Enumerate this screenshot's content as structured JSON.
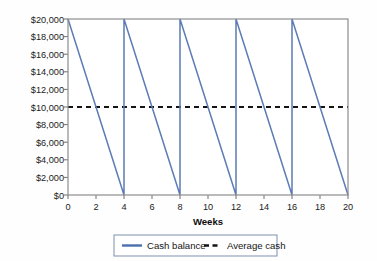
{
  "chart_data": {
    "type": "line",
    "title": "",
    "subtitle": "",
    "xlabel": "Weeks",
    "ylabel": "",
    "xlim": [
      0,
      20
    ],
    "ylim": [
      0,
      20000
    ],
    "grid": false,
    "legend_position": "bottom",
    "x_ticks": [
      0,
      2,
      4,
      6,
      8,
      10,
      12,
      14,
      16,
      18,
      20
    ],
    "x_tick_labels": [
      "0",
      "2",
      "4",
      "6",
      "8",
      "10",
      "12",
      "14",
      "16",
      "18",
      "20"
    ],
    "y_ticks": [
      0,
      2000,
      4000,
      6000,
      8000,
      10000,
      12000,
      14000,
      16000,
      18000,
      20000
    ],
    "y_tick_labels": [
      "$0",
      "$2,000",
      "$4,000",
      "$6,000",
      "$8,000",
      "$10,000",
      "$12,000",
      "$14,000",
      "$16,000",
      "$18,000",
      "$20,000"
    ],
    "series": [
      {
        "name": "Cash balance",
        "style": "solid",
        "color": "#5b7cb4",
        "x": [
          0,
          4,
          4,
          8,
          8,
          12,
          12,
          16,
          16,
          20
        ],
        "values": [
          20000,
          0,
          20000,
          0,
          20000,
          0,
          20000,
          0,
          20000,
          0
        ]
      },
      {
        "name": "Average cash",
        "style": "dashed",
        "color": "#141414",
        "x": [
          0,
          20
        ],
        "values": [
          10000,
          10000
        ]
      }
    ]
  },
  "legend": {
    "items": [
      {
        "label": "Cash balance",
        "marker": "solid-line-swatch",
        "color": "#4a6fb0"
      },
      {
        "label": "Average cash",
        "marker": "dashed-line-swatch",
        "color": "#141414"
      }
    ]
  },
  "colors": {
    "cash_balance_line": "#5b7cb4",
    "average_cash_line": "#141414",
    "plot_frame": "#8d8d8d",
    "legend_border": "#7e8fae",
    "background": "#fefefe"
  }
}
